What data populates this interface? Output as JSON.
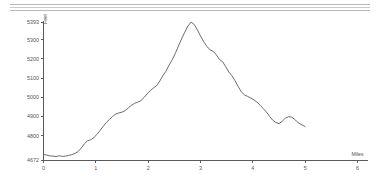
{
  "decor": {
    "top_rule_name": "horizontal-rule-band",
    "line_color": "#b9b9b9"
  },
  "chart_data": {
    "type": "line",
    "title": "",
    "subtitle": "",
    "xlabel": "Miles",
    "ylabel": "Feet",
    "grid": false,
    "legend": false,
    "line_color": "#6b6b6b",
    "axis_color": "#5a5a5a",
    "xlim": [
      0,
      6.2
    ],
    "ylim": [
      4672,
      5393
    ],
    "xticks": [
      0,
      1,
      2,
      3,
      4,
      5,
      6
    ],
    "xtick_labels": [
      "0",
      "1",
      "2",
      "3",
      "4",
      "5",
      "6"
    ],
    "yticks": [
      4672,
      4800,
      4900,
      5000,
      5100,
      5200,
      5300,
      5393
    ],
    "ytick_labels": [
      "4672",
      "4800",
      "4900",
      "5000",
      "5100",
      "5200",
      "5300",
      "5393"
    ],
    "series": [
      {
        "name": "elevation",
        "x": [
          0.0,
          0.06,
          0.12,
          0.18,
          0.24,
          0.3,
          0.36,
          0.42,
          0.48,
          0.54,
          0.6,
          0.66,
          0.72,
          0.78,
          0.84,
          0.9,
          0.96,
          1.02,
          1.08,
          1.14,
          1.2,
          1.26,
          1.32,
          1.38,
          1.44,
          1.5,
          1.56,
          1.62,
          1.68,
          1.74,
          1.8,
          1.86,
          1.92,
          1.98,
          2.04,
          2.1,
          2.16,
          2.22,
          2.28,
          2.34,
          2.4,
          2.46,
          2.52,
          2.58,
          2.64,
          2.7,
          2.76,
          2.82,
          2.88,
          2.94,
          3.0,
          3.06,
          3.12,
          3.18,
          3.24,
          3.3,
          3.36,
          3.42,
          3.48,
          3.54,
          3.6,
          3.66,
          3.72,
          3.78,
          3.84,
          3.9,
          3.96,
          4.02,
          4.08,
          4.14,
          4.2,
          4.26,
          4.32,
          4.38,
          4.44,
          4.5,
          4.56,
          4.62,
          4.68,
          4.74,
          4.8,
          4.86,
          4.92,
          4.98,
          5.0
        ],
        "y": [
          4700,
          4698,
          4694,
          4692,
          4690,
          4694,
          4691,
          4692,
          4696,
          4700,
          4706,
          4716,
          4734,
          4756,
          4772,
          4778,
          4788,
          4806,
          4826,
          4848,
          4868,
          4884,
          4900,
          4912,
          4918,
          4922,
          4930,
          4944,
          4958,
          4968,
          4974,
          4982,
          4998,
          5018,
          5034,
          5048,
          5060,
          5084,
          5112,
          5136,
          5168,
          5196,
          5230,
          5268,
          5306,
          5340,
          5372,
          5393,
          5380,
          5352,
          5320,
          5290,
          5266,
          5248,
          5240,
          5222,
          5198,
          5186,
          5160,
          5132,
          5112,
          5086,
          5056,
          5028,
          5012,
          5004,
          4996,
          4986,
          4974,
          4958,
          4940,
          4922,
          4900,
          4880,
          4868,
          4862,
          4874,
          4890,
          4898,
          4896,
          4884,
          4868,
          4858,
          4850,
          4846
        ]
      }
    ],
    "annotations": []
  }
}
